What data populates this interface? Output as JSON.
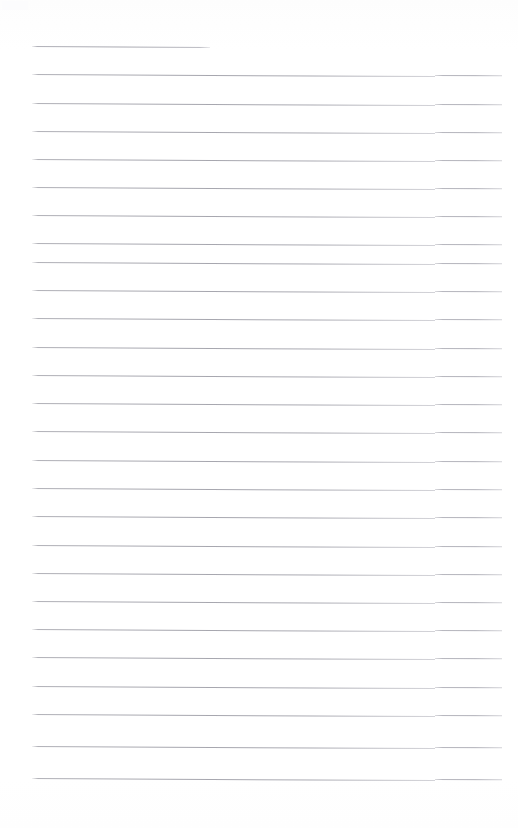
{
  "document": {
    "type": "lined-paper-scan",
    "title": "Blank ruled notepad page",
    "page_width": 518,
    "page_height": 828,
    "background_color": "#ffffff",
    "rule_color": "#a8a8b0",
    "rule_thickness_px": 1,
    "rule_skew_degrees": 0.3,
    "left_margin_px": 32,
    "right_edge_px": 502,
    "first_rule_right_edge_px": 210,
    "rule_spacing_px": 28.2,
    "first_rule_y_px": 46,
    "step_discontinuity_x_px": 435,
    "rule_count": 27,
    "written_text": "",
    "rules": [
      {
        "index": 1,
        "y": 46,
        "x_start": 32,
        "x_end": 210,
        "short": true
      },
      {
        "index": 2,
        "y": 74,
        "x_start": 32,
        "x_end": 502,
        "short": false
      },
      {
        "index": 3,
        "y": 103,
        "x_start": 32,
        "x_end": 502,
        "short": false
      },
      {
        "index": 4,
        "y": 131,
        "x_start": 32,
        "x_end": 502,
        "short": false
      },
      {
        "index": 5,
        "y": 159,
        "x_start": 32,
        "x_end": 502,
        "short": false
      },
      {
        "index": 6,
        "y": 187,
        "x_start": 32,
        "x_end": 502,
        "short": false
      },
      {
        "index": 7,
        "y": 215,
        "x_start": 32,
        "x_end": 502,
        "short": false
      },
      {
        "index": 8,
        "y": 243,
        "x_start": 32,
        "x_end": 502,
        "short": false
      },
      {
        "index": 9,
        "y": 262,
        "x_start": 32,
        "x_end": 502,
        "short": false
      },
      {
        "index": 10,
        "y": 290,
        "x_start": 32,
        "x_end": 502,
        "short": false
      },
      {
        "index": 11,
        "y": 318,
        "x_start": 32,
        "x_end": 502,
        "short": false
      },
      {
        "index": 12,
        "y": 347,
        "x_start": 32,
        "x_end": 502,
        "short": false
      },
      {
        "index": 13,
        "y": 375,
        "x_start": 32,
        "x_end": 502,
        "short": false
      },
      {
        "index": 14,
        "y": 403,
        "x_start": 32,
        "x_end": 502,
        "short": false
      },
      {
        "index": 15,
        "y": 431,
        "x_start": 32,
        "x_end": 502,
        "short": false
      },
      {
        "index": 16,
        "y": 460,
        "x_start": 32,
        "x_end": 502,
        "short": false
      },
      {
        "index": 17,
        "y": 488,
        "x_start": 32,
        "x_end": 502,
        "short": false
      },
      {
        "index": 18,
        "y": 516,
        "x_start": 32,
        "x_end": 502,
        "short": false
      },
      {
        "index": 19,
        "y": 545,
        "x_start": 32,
        "x_end": 502,
        "short": false
      },
      {
        "index": 20,
        "y": 573,
        "x_start": 32,
        "x_end": 502,
        "short": false
      },
      {
        "index": 21,
        "y": 601,
        "x_start": 32,
        "x_end": 502,
        "short": false
      },
      {
        "index": 22,
        "y": 629,
        "x_start": 32,
        "x_end": 502,
        "short": false
      },
      {
        "index": 23,
        "y": 657,
        "x_start": 32,
        "x_end": 502,
        "short": false
      },
      {
        "index": 24,
        "y": 686,
        "x_start": 32,
        "x_end": 502,
        "short": false
      },
      {
        "index": 25,
        "y": 714,
        "x_start": 32,
        "x_end": 502,
        "short": false
      },
      {
        "index": 26,
        "y": 746,
        "x_start": 32,
        "x_end": 502,
        "short": false
      },
      {
        "index": 27,
        "y": 778,
        "x_start": 32,
        "x_end": 502,
        "short": false
      }
    ]
  }
}
